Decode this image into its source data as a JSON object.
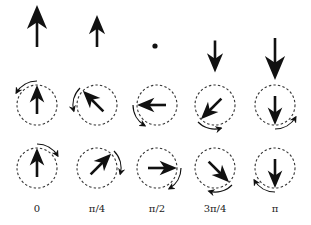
{
  "figure": {
    "columns": [
      {
        "label": "0",
        "x": 37,
        "top_arrow": {
          "dir": "up",
          "len": 42,
          "tip_y": 5,
          "tail_y": 47
        },
        "row2": {
          "angle": 0,
          "rot": "ccw"
        },
        "row3": {
          "angle": 0,
          "rot": "cw"
        }
      },
      {
        "label": "π/4",
        "x": 97,
        "top_arrow": {
          "dir": "up",
          "len": 32,
          "tip_y": 15,
          "tail_y": 47
        },
        "row2": {
          "angle": -45,
          "rot": "ccw"
        },
        "row3": {
          "angle": 45,
          "rot": "cw"
        }
      },
      {
        "label": "π/2",
        "x": 157,
        "top_arrow": {
          "dir": "dot",
          "len": 0,
          "tip_y": 46,
          "tail_y": 46
        },
        "row2": {
          "angle": -90,
          "rot": "ccw"
        },
        "row3": {
          "angle": 90,
          "rot": "cw"
        }
      },
      {
        "label": "3π/4",
        "x": 215,
        "top_arrow": {
          "dir": "down",
          "len": 32,
          "tip_y": 73,
          "tail_y": 40
        },
        "row2": {
          "angle": -135,
          "rot": "ccw"
        },
        "row3": {
          "angle": 135,
          "rot": "cw"
        }
      },
      {
        "label": "π",
        "x": 275,
        "top_arrow": {
          "dir": "down",
          "len": 42,
          "tip_y": 80,
          "tail_y": 38
        },
        "row2": {
          "angle": 180,
          "rot": "ccw"
        },
        "row3": {
          "angle": 180,
          "rot": "cw"
        }
      }
    ],
    "rows": {
      "row2_cy": 105,
      "row3_cy": 168,
      "radius": 20
    },
    "colors": {
      "ink": "#111111",
      "circle": "#333333"
    }
  }
}
